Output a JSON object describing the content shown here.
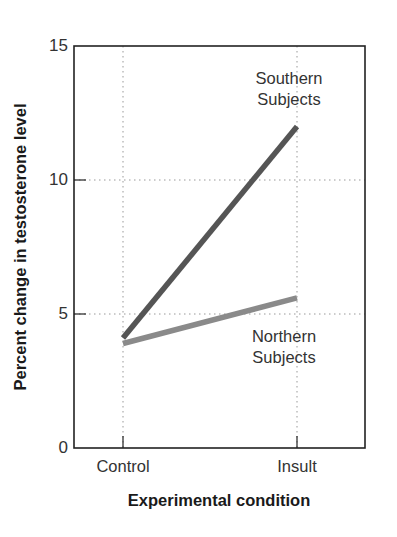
{
  "chart_data": {
    "type": "line",
    "title": "",
    "xlabel": "Experimental condition",
    "ylabel": "Percent change in testosterone level",
    "categories": [
      "Control",
      "Insult"
    ],
    "series": [
      {
        "name": "Southern Subjects",
        "values": [
          4.1,
          12.0
        ],
        "color": "#555555"
      },
      {
        "name": "Northern Subjects",
        "values": [
          3.9,
          5.6
        ],
        "color": "#8a8a8a"
      }
    ],
    "ylim": [
      0,
      15
    ],
    "yticks": [
      0,
      5,
      10,
      15
    ],
    "grid": true,
    "annotations": [
      {
        "text_line1": "Southern",
        "text_line2": "Subjects",
        "near": "Insult, 12"
      },
      {
        "text_line1": "Northern",
        "text_line2": "Subjects",
        "near": "Insult, 5.6"
      }
    ]
  },
  "axes": {
    "y_title": "Percent change in testosterone level",
    "x_title": "Experimental condition",
    "y_ticks": [
      "0",
      "5",
      "10",
      "15"
    ],
    "x_ticks": [
      "Control",
      "Insult"
    ]
  },
  "labels": {
    "southern_line1": "Southern",
    "southern_line2": "Subjects",
    "northern_line1": "Northern",
    "northern_line2": "Subjects"
  }
}
